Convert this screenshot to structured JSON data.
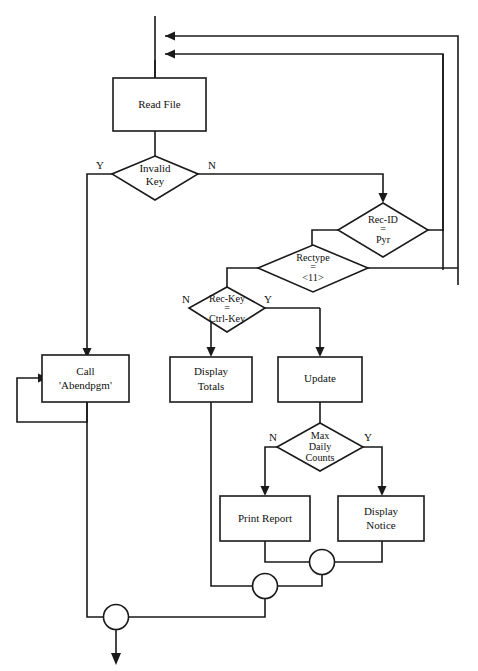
{
  "diagram": {
    "type": "flowchart",
    "background_color": "#ffffff",
    "line_color": "#1a1a1a",
    "nodes": [
      {
        "id": "read_file",
        "shape": "process",
        "label_line1": "Read File",
        "label_line2": ""
      },
      {
        "id": "invalid_key",
        "shape": "decision",
        "label_line1": "Invalid",
        "label_line2": "Key",
        "label_line3": ""
      },
      {
        "id": "rec_id",
        "shape": "decision",
        "label_line1": "Rec-ID",
        "label_line2": "=",
        "label_line3": "Pyr"
      },
      {
        "id": "rectype",
        "shape": "decision",
        "label_line1": "Rectype",
        "label_line2": "=",
        "label_line3": "<11>"
      },
      {
        "id": "rec_key",
        "shape": "decision",
        "label_line1": "Rec-Key",
        "label_line2": "=",
        "label_line3": "Ctrl-Key"
      },
      {
        "id": "call_abend",
        "shape": "process",
        "label_line1": "Call",
        "label_line2": "'Abendpgm'"
      },
      {
        "id": "display_totals",
        "shape": "process",
        "label_line1": "Display",
        "label_line2": "Totals"
      },
      {
        "id": "update",
        "shape": "process",
        "label_line1": "Update",
        "label_line2": ""
      },
      {
        "id": "max_daily",
        "shape": "decision",
        "label_line1": "Max",
        "label_line2": "Daily",
        "label_line3": "Counts"
      },
      {
        "id": "print_report",
        "shape": "process",
        "label_line1": "Print Report",
        "label_line2": ""
      },
      {
        "id": "display_notice",
        "shape": "process",
        "label_line1": "Display",
        "label_line2": "Notice"
      },
      {
        "id": "merge_top",
        "shape": "connector",
        "label_line1": ""
      },
      {
        "id": "merge_mid",
        "shape": "connector",
        "label_line1": ""
      },
      {
        "id": "merge_bottom",
        "shape": "connector",
        "label_line1": ""
      }
    ],
    "branch_labels": {
      "invalid_key_yes": "Y",
      "invalid_key_no": "N",
      "rec_key_no": "N",
      "rec_key_yes": "Y",
      "max_daily_no": "N",
      "max_daily_yes": "Y"
    }
  }
}
